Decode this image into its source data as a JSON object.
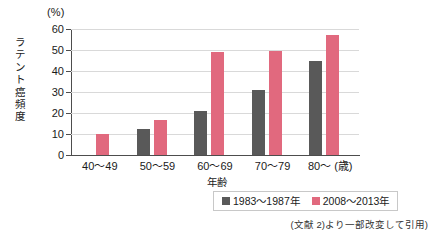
{
  "chart_data": {
    "type": "bar",
    "title": "",
    "unit_label": "(%)",
    "xlabel": "年齢",
    "ylabel": "ラテント癌頻度",
    "categories": [
      "40～49",
      "50～59",
      "60～69",
      "70～79",
      "80～"
    ],
    "category_suffix": "(歳)",
    "ylim": [
      0,
      60
    ],
    "yticks": [
      0,
      10,
      20,
      30,
      40,
      50,
      60
    ],
    "ytick_labels": [
      "0",
      "10",
      "20",
      "30",
      "40",
      "50",
      "60"
    ],
    "grid": true,
    "legend_position": "bottom-center",
    "series": [
      {
        "name": "1983～1987年",
        "color": "#595959",
        "values": [
          0,
          12.5,
          21,
          31,
          45
        ]
      },
      {
        "name": "2008～2013年",
        "color": "#e1697e",
        "values": [
          10,
          16.5,
          49,
          49.5,
          57
        ]
      }
    ],
    "source_note": "(文献 2)より一部改変して引用)"
  }
}
